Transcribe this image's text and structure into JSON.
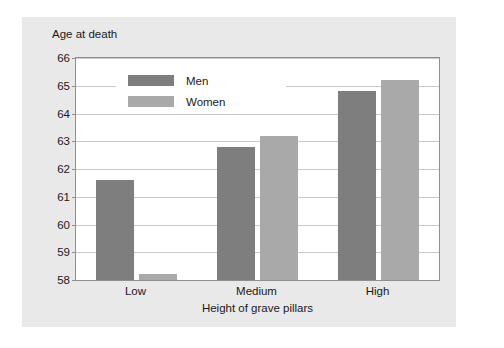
{
  "chart_data": {
    "type": "bar",
    "title": "",
    "ylabel": "Age at death",
    "xlabel": "Height of grave pillars",
    "categories": [
      "Low",
      "Medium",
      "High"
    ],
    "series": [
      {
        "name": "Men",
        "color": "#7e7e7e",
        "values": [
          61.6,
          62.8,
          64.8
        ]
      },
      {
        "name": "Women",
        "color": "#a9a9a9",
        "values": [
          58.2,
          63.2,
          65.2
        ]
      }
    ],
    "ylim": [
      58,
      66
    ],
    "yticks": [
      58,
      59,
      60,
      61,
      62,
      63,
      64,
      65,
      66
    ],
    "ytick_labels": [
      "58",
      "59",
      "60",
      "61",
      "62",
      "63",
      "64",
      "65",
      "66"
    ],
    "grid": true,
    "legend_position": "top-left-inside"
  }
}
